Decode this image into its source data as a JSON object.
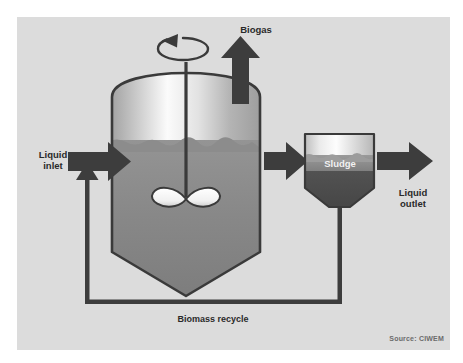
{
  "figure": {
    "kind": "process-flow-diagram",
    "panel_background": "#dcdcdc",
    "page_background": "#ffffff",
    "ink_color": "#3a3a3a",
    "source_credit": "Source: CIWEM"
  },
  "labels": {
    "liquid_inlet_line1": "Liquid",
    "liquid_inlet_line2": "inlet",
    "biogas": "Biogas",
    "sludge": "Sludge",
    "liquid_outlet_line1": "Liquid",
    "liquid_outlet_line2": "outlet",
    "biomass_recycle": "Biomass recycle"
  },
  "components": {
    "digester": {
      "name": "Anaerobic digester vessel",
      "headspace_fill": "gas headspace gradient",
      "liquid_fill": "mixed liquor",
      "has_domed_top": true,
      "has_conical_bottom": true
    },
    "mixer": {
      "name": "Mechanical mixer",
      "shaft": "vertical drive shaft",
      "impeller": "two-blade paddle impeller",
      "rotation_icon": "rotation-arrow"
    },
    "settler": {
      "name": "Sludge settling tank",
      "bands": [
        "clear liquid",
        "sludge blanket",
        "settled sludge"
      ],
      "has_hopper_bottom": true
    },
    "flows": [
      {
        "id": "inlet",
        "label": "Liquid inlet",
        "direction": "right"
      },
      {
        "id": "biogas",
        "label": "Biogas",
        "direction": "up"
      },
      {
        "id": "transfer",
        "label": "",
        "direction": "right"
      },
      {
        "id": "outlet",
        "label": "Liquid outlet",
        "direction": "right"
      },
      {
        "id": "recycle",
        "label": "Biomass recycle",
        "direction": "left"
      }
    ]
  },
  "colors": {
    "panel": "#dcdcdc",
    "ink": "#3a3a3a",
    "arrow": "#3d3d3d",
    "liquid_top": "#8e8e8e",
    "liquid_bottom": "#7d7d7d",
    "headspace_light": "#fbfbfb",
    "headspace_dark": "#9a9a9a",
    "settler_dark": "#4a4a4a",
    "settler_mid": "#8a8a8a",
    "label": "#2a2a2a",
    "sludge_label": "#f2f2f2",
    "source": "#6b6b6b"
  }
}
